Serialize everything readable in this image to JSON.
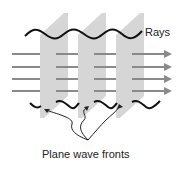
{
  "diagram": {
    "labels": {
      "rays": "Rays",
      "wave_fronts": "Plane wave fronts"
    },
    "colors": {
      "plane_fill": "#d4d4d4",
      "plane_shade": "#bfbfbf",
      "ray": "#8a8a8a",
      "wave": "#111111",
      "callout": "#222222"
    },
    "planes": [
      {
        "name": "wave-front-1"
      },
      {
        "name": "wave-front-2"
      },
      {
        "name": "wave-front-3"
      }
    ],
    "ray_count": 4
  }
}
